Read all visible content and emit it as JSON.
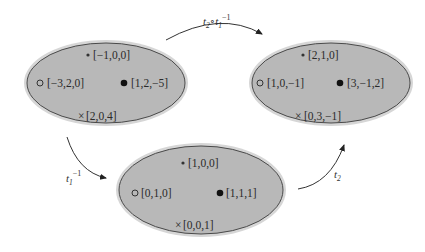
{
  "colors": {
    "ellipse_fill": "#b8b8b8",
    "ellipse_halo": "#d6d6d6",
    "ellipse_stroke": "#4a4a4a",
    "text": "#2a2a2a",
    "arrow": "#333333"
  },
  "sets": [
    {
      "id": "left",
      "points": [
        {
          "marker": "star-dot",
          "label": "[−1,0,0]"
        },
        {
          "marker": "open-circle",
          "label": "[−3,2,0]"
        },
        {
          "marker": "filled-circle",
          "label": "[1,2,−5]"
        },
        {
          "marker": "cross",
          "label": "[2,0,4]"
        }
      ]
    },
    {
      "id": "right",
      "points": [
        {
          "marker": "star-dot",
          "label": "[2,1,0]"
        },
        {
          "marker": "open-circle",
          "label": "[1,0,−1]"
        },
        {
          "marker": "filled-circle",
          "label": "[3,−1,2]"
        },
        {
          "marker": "cross",
          "label": "[0,3,−1]"
        }
      ]
    },
    {
      "id": "bottom",
      "points": [
        {
          "marker": "star-dot",
          "label": "[1,0,0]"
        },
        {
          "marker": "open-circle",
          "label": "[0,1,0]"
        },
        {
          "marker": "filled-circle",
          "label": "[1,1,1]"
        },
        {
          "marker": "cross",
          "label": "[0,0,1]"
        }
      ]
    }
  ],
  "arrows": [
    {
      "id": "top",
      "from": "left",
      "to": "right",
      "label_base": "t",
      "label_parts": [
        "t",
        "2",
        "∘",
        "t",
        "1",
        "−1"
      ]
    },
    {
      "id": "left-down",
      "from": "left",
      "to": "bottom",
      "label_parts": [
        "t",
        "1",
        "−1"
      ]
    },
    {
      "id": "right-up",
      "from": "bottom",
      "to": "right",
      "label_parts": [
        "t",
        "2"
      ]
    }
  ]
}
